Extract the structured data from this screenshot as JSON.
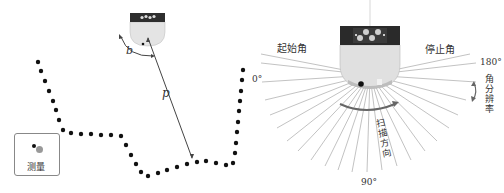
{
  "left_panel": {
    "title": "LiDAR measurement of contour",
    "labels": {
      "angle_symbol": "b",
      "distance_symbol": "p"
    },
    "legend": {
      "label": "测量"
    }
  },
  "right_panel": {
    "labels": {
      "start_angle": "起始角",
      "stop_angle": "停止角",
      "deg_0": "0°",
      "deg_180": "180°",
      "deg_90": "90°",
      "angular_resolution": "角分辨率",
      "scan_direction": "扫描方向"
    }
  },
  "colors": {
    "sensor_top": "#2a2a2a",
    "sensor_body": "#dcdcdc",
    "dot": "#111111",
    "ray": "#999999",
    "arrow": "#555555"
  }
}
